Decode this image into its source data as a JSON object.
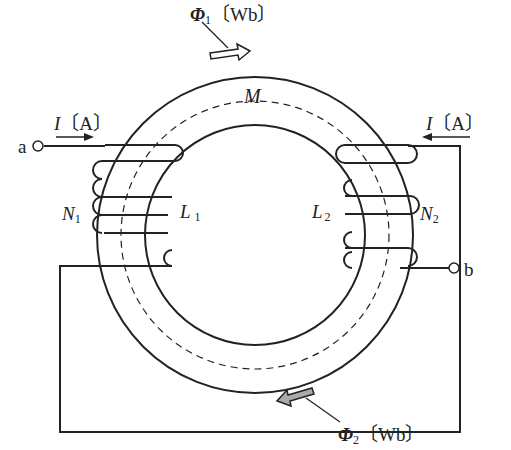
{
  "labels": {
    "phi1_sym": "Φ",
    "phi1_sub": "1",
    "phi1_unit": "〔Wb〕",
    "phi2_sym": "Φ",
    "phi2_sub": "2",
    "phi2_unit": "〔Wb〕",
    "mutual": "M",
    "current_left_sym": "I",
    "current_left_unit": "〔A〕",
    "current_right_sym": "I",
    "current_right_unit": "〔A〕",
    "terminal_a": "a",
    "terminal_b": "b",
    "N1_sym": "N",
    "N1_sub": "1",
    "N2_sym": "N",
    "N2_sub": "2",
    "L1_sym": "L",
    "L1_sub": "1",
    "L2_sym": "L",
    "L2_sub": "2"
  },
  "colors": {
    "line": "#222222",
    "phi1_arrow_fill": "#ffffff",
    "phi2_arrow_fill": "#aaaaaa"
  }
}
